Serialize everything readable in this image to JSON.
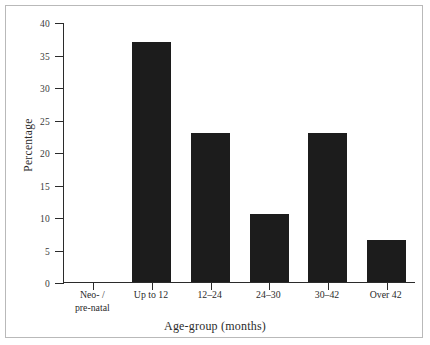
{
  "chart_data": {
    "type": "bar",
    "title": "",
    "xlabel": "Age-group (months)",
    "ylabel": "Percentage",
    "categories": [
      "Neo- /\npre-natal",
      "Up to 12",
      "12–24",
      "24–30",
      "30–42",
      "Over 42"
    ],
    "values": [
      0,
      37,
      23,
      10.5,
      23,
      6.5
    ],
    "ylim": [
      0,
      40
    ],
    "yticks": [
      0,
      5,
      10,
      15,
      20,
      25,
      30,
      35,
      40
    ],
    "ytick_labels": [
      "0",
      "5",
      "10",
      "15",
      "20",
      "25",
      "30",
      "35",
      "40"
    ],
    "grid": false,
    "legend": "none",
    "bar_color": "#1c1c1c",
    "axis_color": "#2b2b2b",
    "frame_color": "#b9b9b9",
    "background": "#ffffff"
  }
}
